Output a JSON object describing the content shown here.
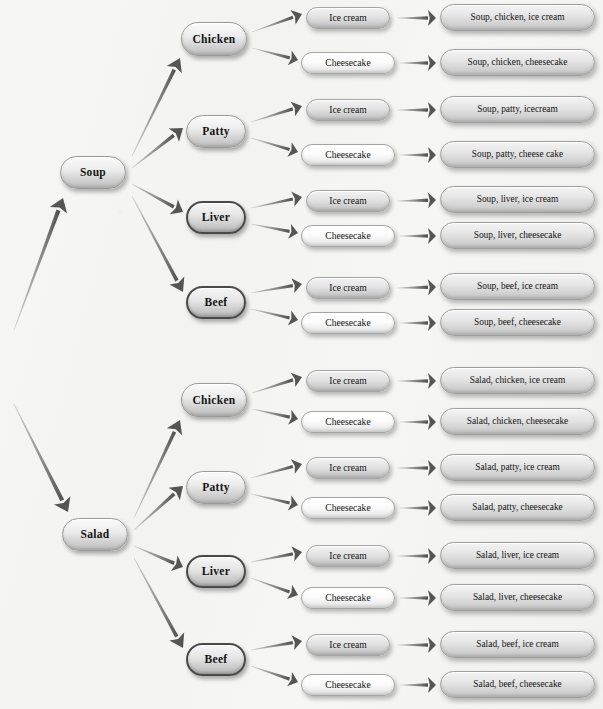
{
  "diagram": {
    "type": "probability-tree",
    "colors": {
      "background": "#f4f4f2",
      "node_fill_light": "#fbfbfb",
      "node_fill_gray": "#dcdcdc",
      "node_border": "#9a9a9a",
      "node_border_dark": "#4a4a4a",
      "arrow": "#6f6f6f",
      "text": "#141414"
    },
    "levels": [
      {
        "name": "starter",
        "labels": [
          "Soup",
          "Salad"
        ]
      },
      {
        "name": "main-course",
        "labels": [
          "Chicken",
          "Patty",
          "Liver",
          "Beef"
        ]
      },
      {
        "name": "dessert",
        "labels": [
          "Ice cream",
          "Cheesecake"
        ]
      },
      {
        "name": "outcome",
        "labels": []
      }
    ]
  },
  "nodes": {
    "starters": [
      {
        "id": "soup",
        "label": "Soup",
        "x": 60,
        "y": 156,
        "w": 66,
        "h": 33
      },
      {
        "id": "salad",
        "label": "Salad",
        "x": 62,
        "y": 518,
        "w": 66,
        "h": 33
      }
    ],
    "mains": [
      {
        "id": "soup-chicken",
        "label": "Chicken",
        "x": 181,
        "y": 22,
        "w": 66,
        "h": 34,
        "dark": false
      },
      {
        "id": "soup-patty",
        "label": "Patty",
        "x": 186,
        "y": 115,
        "w": 60,
        "h": 33,
        "dark": false
      },
      {
        "id": "soup-liver",
        "label": "Liver",
        "x": 186,
        "y": 201,
        "w": 60,
        "h": 33,
        "dark": true
      },
      {
        "id": "soup-beef",
        "label": "Beef",
        "x": 186,
        "y": 286,
        "w": 60,
        "h": 33,
        "dark": true
      },
      {
        "id": "salad-chicken",
        "label": "Chicken",
        "x": 181,
        "y": 383,
        "w": 66,
        "h": 34,
        "dark": false
      },
      {
        "id": "salad-patty",
        "label": "Patty",
        "x": 186,
        "y": 471,
        "w": 60,
        "h": 33,
        "dark": false
      },
      {
        "id": "salad-liver",
        "label": "Liver",
        "x": 186,
        "y": 555,
        "w": 60,
        "h": 33,
        "dark": true
      },
      {
        "id": "salad-beef",
        "label": "Beef",
        "x": 186,
        "y": 643,
        "w": 60,
        "h": 33,
        "dark": true
      }
    ],
    "desserts": [
      {
        "id": "d1",
        "label": "Ice cream",
        "x": 306,
        "y": 7,
        "w": 84,
        "h": 22,
        "style": "gray"
      },
      {
        "id": "d2",
        "label": "Cheesecake",
        "x": 301,
        "y": 52,
        "w": 94,
        "h": 22,
        "style": "light"
      },
      {
        "id": "d3",
        "label": "Ice cream",
        "x": 306,
        "y": 99,
        "w": 84,
        "h": 22,
        "style": "gray"
      },
      {
        "id": "d4",
        "label": "Cheesecake",
        "x": 301,
        "y": 144,
        "w": 94,
        "h": 22,
        "style": "light"
      },
      {
        "id": "d5",
        "label": "Ice cream",
        "x": 306,
        "y": 190,
        "w": 84,
        "h": 22,
        "style": "gray"
      },
      {
        "id": "d6",
        "label": "Cheesecake",
        "x": 301,
        "y": 225,
        "w": 94,
        "h": 22,
        "style": "light"
      },
      {
        "id": "d7",
        "label": "Ice cream",
        "x": 306,
        "y": 277,
        "w": 84,
        "h": 22,
        "style": "gray"
      },
      {
        "id": "d8",
        "label": "Cheesecake",
        "x": 301,
        "y": 312,
        "w": 94,
        "h": 22,
        "style": "light"
      },
      {
        "id": "d9",
        "label": "Ice cream",
        "x": 306,
        "y": 370,
        "w": 84,
        "h": 22,
        "style": "gray"
      },
      {
        "id": "d10",
        "label": "Cheesecake",
        "x": 301,
        "y": 411,
        "w": 94,
        "h": 22,
        "style": "light"
      },
      {
        "id": "d11",
        "label": "Ice cream",
        "x": 306,
        "y": 457,
        "w": 84,
        "h": 22,
        "style": "gray"
      },
      {
        "id": "d12",
        "label": "Cheesecake",
        "x": 301,
        "y": 497,
        "w": 94,
        "h": 22,
        "style": "light"
      },
      {
        "id": "d13",
        "label": "Ice cream",
        "x": 306,
        "y": 545,
        "w": 84,
        "h": 22,
        "style": "gray"
      },
      {
        "id": "d14",
        "label": "Cheesecake",
        "x": 301,
        "y": 587,
        "w": 94,
        "h": 22,
        "style": "light"
      },
      {
        "id": "d15",
        "label": "Ice cream",
        "x": 306,
        "y": 634,
        "w": 84,
        "h": 22,
        "style": "gray"
      },
      {
        "id": "d16",
        "label": "Cheesecake",
        "x": 301,
        "y": 674,
        "w": 94,
        "h": 22,
        "style": "light"
      }
    ],
    "outcomes": [
      {
        "id": "o1",
        "label": "Soup, chicken, ice cream",
        "x": 440,
        "y": 4,
        "w": 155,
        "h": 27
      },
      {
        "id": "o2",
        "label": "Soup, chicken, cheesecake",
        "x": 440,
        "y": 49,
        "w": 155,
        "h": 27
      },
      {
        "id": "o3",
        "label": "Soup, patty, icecream",
        "x": 440,
        "y": 96,
        "w": 155,
        "h": 27
      },
      {
        "id": "o4",
        "label": "Soup, patty, cheese cake",
        "x": 440,
        "y": 141,
        "w": 155,
        "h": 27
      },
      {
        "id": "o5",
        "label": "Soup, liver, ice cream",
        "x": 440,
        "y": 186,
        "w": 155,
        "h": 27
      },
      {
        "id": "o6",
        "label": "Soup, liver, cheesecake",
        "x": 440,
        "y": 222,
        "w": 155,
        "h": 27
      },
      {
        "id": "o7",
        "label": "Soup, beef, ice cream",
        "x": 440,
        "y": 273,
        "w": 155,
        "h": 27
      },
      {
        "id": "o8",
        "label": "Soup, beef, cheesecake",
        "x": 440,
        "y": 309,
        "w": 155,
        "h": 27
      },
      {
        "id": "o9",
        "label": "Salad, chicken, ice cream",
        "x": 440,
        "y": 367,
        "w": 155,
        "h": 27
      },
      {
        "id": "o10",
        "label": "Salad, chicken, cheesecake",
        "x": 440,
        "y": 408,
        "w": 155,
        "h": 27
      },
      {
        "id": "o11",
        "label": "Salad, patty, ice cream",
        "x": 440,
        "y": 454,
        "w": 155,
        "h": 27
      },
      {
        "id": "o12",
        "label": "Salad, patty, cheesecake",
        "x": 440,
        "y": 494,
        "w": 155,
        "h": 27
      },
      {
        "id": "o13",
        "label": "Salad, liver, ice cream",
        "x": 440,
        "y": 542,
        "w": 155,
        "h": 27
      },
      {
        "id": "o14",
        "label": "Salad, liver, cheesecake",
        "x": 440,
        "y": 584,
        "w": 155,
        "h": 27
      },
      {
        "id": "o15",
        "label": "Salad, beef, ice cream",
        "x": 440,
        "y": 631,
        "w": 155,
        "h": 27
      },
      {
        "id": "o16",
        "label": "Salad, beef, cheesecake",
        "x": 440,
        "y": 671,
        "w": 155,
        "h": 27
      }
    ]
  },
  "edges": {
    "root_to_starters": [
      {
        "id": "e-root-soup",
        "x1": 14,
        "y1": 330,
        "x2": 63,
        "y2": 198,
        "w": 3.4
      },
      {
        "id": "e-root-salad",
        "x1": 14,
        "y1": 404,
        "x2": 68,
        "y2": 512,
        "w": 3.4
      }
    ],
    "starter_to_main": [
      {
        "id": "e-soup-chicken",
        "x1": 132,
        "y1": 156,
        "x2": 180,
        "y2": 58,
        "w": 3.0
      },
      {
        "id": "e-soup-patty",
        "x1": 132,
        "y1": 168,
        "x2": 183,
        "y2": 128,
        "w": 3.0
      },
      {
        "id": "e-soup-liver",
        "x1": 132,
        "y1": 184,
        "x2": 183,
        "y2": 212,
        "w": 3.0
      },
      {
        "id": "e-soup-beef",
        "x1": 132,
        "y1": 196,
        "x2": 183,
        "y2": 292,
        "w": 3.0
      },
      {
        "id": "e-salad-chicken",
        "x1": 134,
        "y1": 518,
        "x2": 180,
        "y2": 420,
        "w": 3.0
      },
      {
        "id": "e-salad-patty",
        "x1": 134,
        "y1": 530,
        "x2": 183,
        "y2": 486,
        "w": 3.0
      },
      {
        "id": "e-salad-liver",
        "x1": 134,
        "y1": 546,
        "x2": 183,
        "y2": 567,
        "w": 3.0
      },
      {
        "id": "e-salad-beef",
        "x1": 134,
        "y1": 558,
        "x2": 183,
        "y2": 648,
        "w": 3.0
      }
    ],
    "main_to_dessert": [
      {
        "id": "e-m1-d1",
        "x1": 252,
        "y1": 32,
        "x2": 302,
        "y2": 14,
        "w": 2.6
      },
      {
        "id": "e-m1-d2",
        "x1": 252,
        "y1": 48,
        "x2": 298,
        "y2": 60,
        "w": 2.6
      },
      {
        "id": "e-m2-d3",
        "x1": 251,
        "y1": 122,
        "x2": 302,
        "y2": 106,
        "w": 2.6
      },
      {
        "id": "e-m2-d4",
        "x1": 251,
        "y1": 138,
        "x2": 298,
        "y2": 152,
        "w": 2.6
      },
      {
        "id": "e-m3-d5",
        "x1": 251,
        "y1": 208,
        "x2": 302,
        "y2": 197,
        "w": 2.6
      },
      {
        "id": "e-m3-d6",
        "x1": 251,
        "y1": 224,
        "x2": 298,
        "y2": 233,
        "w": 2.6
      },
      {
        "id": "e-m4-d7",
        "x1": 251,
        "y1": 293,
        "x2": 302,
        "y2": 284,
        "w": 2.6
      },
      {
        "id": "e-m4-d8",
        "x1": 251,
        "y1": 309,
        "x2": 298,
        "y2": 320,
        "w": 2.6
      },
      {
        "id": "e-m5-d9",
        "x1": 252,
        "y1": 393,
        "x2": 302,
        "y2": 377,
        "w": 2.6
      },
      {
        "id": "e-m5-d10",
        "x1": 252,
        "y1": 409,
        "x2": 298,
        "y2": 419,
        "w": 2.6
      },
      {
        "id": "e-m6-d11",
        "x1": 251,
        "y1": 478,
        "x2": 302,
        "y2": 464,
        "w": 2.6
      },
      {
        "id": "e-m6-d12",
        "x1": 251,
        "y1": 494,
        "x2": 298,
        "y2": 505,
        "w": 2.6
      },
      {
        "id": "e-m7-d13",
        "x1": 251,
        "y1": 562,
        "x2": 302,
        "y2": 552,
        "w": 2.6
      },
      {
        "id": "e-m7-d14",
        "x1": 251,
        "y1": 578,
        "x2": 298,
        "y2": 595,
        "w": 2.6
      },
      {
        "id": "e-m8-d15",
        "x1": 251,
        "y1": 650,
        "x2": 302,
        "y2": 641,
        "w": 2.6
      },
      {
        "id": "e-m8-d16",
        "x1": 251,
        "y1": 666,
        "x2": 298,
        "y2": 682,
        "w": 2.6
      }
    ],
    "dessert_to_outcome": [
      {
        "id": "e-d1-o1",
        "x1": 397,
        "y1": 18,
        "x2": 436,
        "y2": 18,
        "w": 2.8
      },
      {
        "id": "e-d2-o2",
        "x1": 400,
        "y1": 63,
        "x2": 436,
        "y2": 63,
        "w": 2.8
      },
      {
        "id": "e-d3-o3",
        "x1": 397,
        "y1": 110,
        "x2": 436,
        "y2": 110,
        "w": 2.8
      },
      {
        "id": "e-d4-o4",
        "x1": 400,
        "y1": 155,
        "x2": 436,
        "y2": 155,
        "w": 2.8
      },
      {
        "id": "e-d5-o5",
        "x1": 397,
        "y1": 201,
        "x2": 436,
        "y2": 200,
        "w": 2.8
      },
      {
        "id": "e-d6-o6",
        "x1": 400,
        "y1": 236,
        "x2": 436,
        "y2": 236,
        "w": 2.8
      },
      {
        "id": "e-d7-o7",
        "x1": 397,
        "y1": 288,
        "x2": 436,
        "y2": 287,
        "w": 2.8
      },
      {
        "id": "e-d8-o8",
        "x1": 400,
        "y1": 323,
        "x2": 436,
        "y2": 323,
        "w": 2.8
      },
      {
        "id": "e-d9-o9",
        "x1": 397,
        "y1": 381,
        "x2": 436,
        "y2": 381,
        "w": 2.8
      },
      {
        "id": "e-d10-o10",
        "x1": 400,
        "y1": 422,
        "x2": 436,
        "y2": 422,
        "w": 2.8
      },
      {
        "id": "e-d11-o11",
        "x1": 397,
        "y1": 468,
        "x2": 436,
        "y2": 468,
        "w": 2.8
      },
      {
        "id": "e-d12-o12",
        "x1": 400,
        "y1": 508,
        "x2": 436,
        "y2": 508,
        "w": 2.8
      },
      {
        "id": "e-d13-o13",
        "x1": 397,
        "y1": 556,
        "x2": 436,
        "y2": 556,
        "w": 2.8
      },
      {
        "id": "e-d14-o14",
        "x1": 400,
        "y1": 598,
        "x2": 436,
        "y2": 598,
        "w": 2.8
      },
      {
        "id": "e-d15-o15",
        "x1": 397,
        "y1": 645,
        "x2": 436,
        "y2": 645,
        "w": 2.8
      },
      {
        "id": "e-d16-o16",
        "x1": 400,
        "y1": 685,
        "x2": 436,
        "y2": 685,
        "w": 2.8
      }
    ]
  }
}
